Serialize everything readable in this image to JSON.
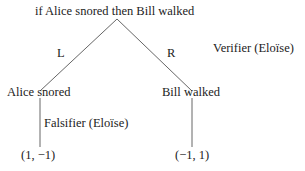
{
  "root": {
    "label": "if Alice snored then Bill walked"
  },
  "root_player": "Verifier (Eloïse)",
  "edges": {
    "left": "L",
    "right": "R"
  },
  "left_node": {
    "label": "Alice snored",
    "player": "Falsifier (Eloïse)",
    "payoff": "(1, −1)"
  },
  "right_node": {
    "label": "Bill walked",
    "payoff": "(−1, 1)"
  },
  "colors": {
    "line": "#555555",
    "text": "#222222"
  }
}
